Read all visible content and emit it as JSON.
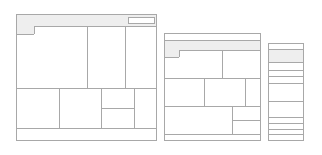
{
  "diagram": {
    "type": "responsive-wireframe-layouts",
    "colors": {
      "stroke": "#a8a8a8",
      "header_fill": "#eeeeee",
      "background": "#ffffff"
    },
    "layouts": [
      {
        "name": "desktop",
        "regions": [
          "header",
          "header-button",
          "logo-notch",
          "content-row-1 (3 cols)",
          "content-row-2 (4 cols, 3rd split)",
          "footer"
        ]
      },
      {
        "name": "tablet",
        "regions": [
          "top-bar",
          "header",
          "logo-notch",
          "row-1 (2 cols)",
          "row-2 (3 cols)",
          "row-3 (2 cols, 2nd split)",
          "footer"
        ]
      },
      {
        "name": "mobile",
        "regions": [
          "top-bar",
          "header",
          "stacked blocks x9"
        ]
      }
    ]
  }
}
